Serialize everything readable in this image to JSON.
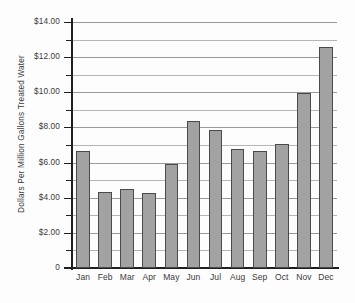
{
  "chart_data": {
    "type": "bar",
    "title": "",
    "subtitle": "",
    "xlabel": "",
    "ylabel": "Dollars Per Million Gallons Treated Water",
    "categories": [
      "Jan",
      "Feb",
      "Mar",
      "Apr",
      "May",
      "Jun",
      "Jul",
      "Aug",
      "Sep",
      "Oct",
      "Nov",
      "Dec"
    ],
    "values": [
      6.65,
      4.3,
      4.5,
      4.25,
      5.9,
      8.35,
      7.85,
      6.75,
      6.65,
      7.05,
      9.95,
      12.55
    ],
    "series": [
      {
        "name": "Dollars Per Million Gallons Treated Water",
        "values": [
          6.65,
          4.3,
          4.5,
          4.25,
          5.9,
          8.35,
          7.85,
          6.75,
          6.65,
          7.05,
          9.95,
          12.55
        ]
      }
    ],
    "ylim": [
      0,
      14
    ],
    "y_major_step": 2,
    "y_minor_step": 1,
    "y_tick_labels": [
      "$14.00",
      "$12.00",
      "$10.00",
      "$8.00",
      "$6.00",
      "$4.00",
      "$2.00",
      "0"
    ],
    "y_tick_values": [
      14,
      12,
      10,
      8,
      6,
      4,
      2,
      0
    ],
    "grid": true,
    "grid_axis": "y",
    "legend": false,
    "legend_position": "none",
    "bar_color": "#a2a2a2",
    "bar_border_color": "#4a4a4a",
    "axis_color": "#1f1f1f",
    "gridline_color": "#9a9a9a",
    "background_color": "#fdfdfd",
    "annotations": []
  }
}
